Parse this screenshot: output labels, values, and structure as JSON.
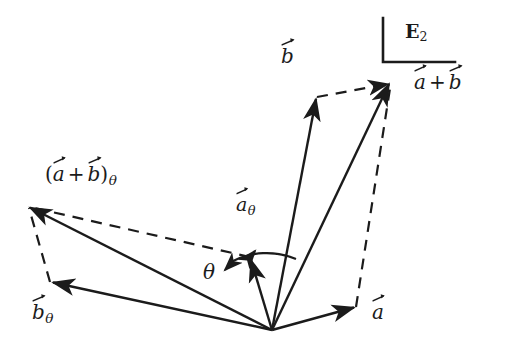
{
  "figure": {
    "background_color": "#ffffff",
    "stroke_color": "#1b1b1b",
    "width": 523,
    "height": 356
  },
  "labels": {
    "space": {
      "symbol": "E",
      "subscript": "2",
      "name": "plane-E2"
    },
    "a": "a",
    "b": "b",
    "plus": "+",
    "theta": "θ",
    "a_theta_base": "a",
    "b_theta_base": "b",
    "paren_open": "(",
    "paren_close": ")",
    "subscript_theta": "θ"
  },
  "geometry": {
    "origin": {
      "x": 272,
      "y": 330
    },
    "vectors": [
      {
        "name": "a",
        "style": "solid",
        "from": [
          272,
          330
        ],
        "to": [
          356,
          307
        ],
        "label": "a"
      },
      {
        "name": "b",
        "style": "solid",
        "from": [
          272,
          330
        ],
        "to": [
          317,
          97
        ],
        "label": "b"
      },
      {
        "name": "a-plus-b",
        "style": "solid",
        "from": [
          272,
          330
        ],
        "to": [
          391,
          82
        ],
        "label": "a + b"
      },
      {
        "name": "a-theta",
        "style": "solid",
        "from": [
          272,
          330
        ],
        "to": [
          250,
          257
        ],
        "label": "a_theta"
      },
      {
        "name": "b-theta",
        "style": "solid",
        "from": [
          272,
          330
        ],
        "to": [
          50,
          282
        ],
        "label": "b_theta"
      },
      {
        "name": "ab-theta",
        "style": "solid",
        "from": [
          272,
          330
        ],
        "to": [
          27,
          205
        ],
        "label": "(a + b)_theta"
      }
    ],
    "dashed_edges": [
      {
        "name": "dash-a-to-sum",
        "from": [
          356,
          307
        ],
        "to": [
          391,
          82
        ]
      },
      {
        "name": "dash-b-to-sum",
        "from": [
          317,
          97
        ],
        "to": [
          391,
          82
        ]
      },
      {
        "name": "dash-btheta-to-sum",
        "from": [
          50,
          282
        ],
        "to": [
          27,
          205
        ]
      },
      {
        "name": "dash-atheta-to-sum",
        "from": [
          250,
          257
        ],
        "to": [
          27,
          205
        ]
      }
    ],
    "angle_arc": {
      "name": "theta-arc",
      "center": [
        272,
        330
      ],
      "radius": 74,
      "start_angle_deg": 107,
      "end_angle_deg": 79,
      "double_headed": true
    },
    "corner_bracket": {
      "name": "e2-frame-bracket",
      "vertical": {
        "x": 383,
        "y1": 18,
        "y2": 62
      },
      "horizontal": {
        "y": 62,
        "x1": 383,
        "x2": 455
      }
    }
  }
}
